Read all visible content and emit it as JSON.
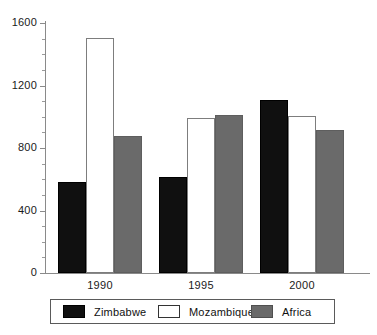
{
  "chart_data": {
    "type": "bar",
    "title": "",
    "subtitle": "",
    "xlabel": "",
    "ylabel": "",
    "categories": [
      "1990",
      "1995",
      "2000"
    ],
    "series": [
      {
        "name": "Zimbabwe",
        "color": "#101010",
        "values": [
          580,
          615,
          1105
        ]
      },
      {
        "name": "Mozambique",
        "color": "#ffffff",
        "values": [
          1505,
          990,
          1005
        ]
      },
      {
        "name": "Africa",
        "color": "#6a6a6a",
        "values": [
          875,
          1010,
          915
        ]
      }
    ],
    "ylim": [
      0,
      1600
    ],
    "ytick_labels": [
      "0",
      "400",
      "800",
      "1200",
      "1600"
    ],
    "ytick_values": [
      0,
      400,
      800,
      1200,
      1600
    ],
    "yminor_step": 100,
    "grid": false,
    "legend_position": "bottom"
  },
  "legend": {
    "entries": [
      {
        "label": "Zimbabwe"
      },
      {
        "label": "Mozambique"
      },
      {
        "label": "Africa"
      }
    ]
  }
}
